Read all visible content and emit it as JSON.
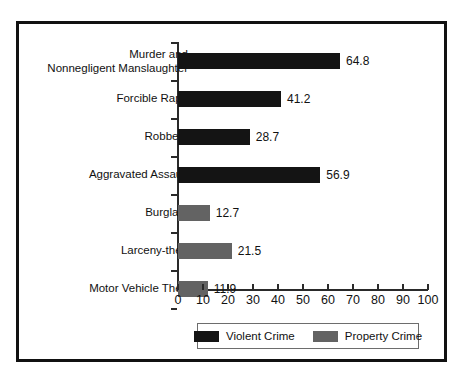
{
  "chart_data": {
    "type": "bar",
    "orientation": "horizontal",
    "title": "",
    "xlabel": "",
    "ylabel": "",
    "xlim": [
      0,
      100
    ],
    "xticks": [
      0,
      10,
      20,
      30,
      40,
      50,
      60,
      70,
      80,
      90,
      100
    ],
    "xtick_labels": [
      "0",
      "10",
      "20",
      "30",
      "40",
      "50",
      "60",
      "70",
      "80",
      "90",
      "100"
    ],
    "grid": false,
    "legend_position": "bottom",
    "categories": [
      "Murder and\nNonnegligent Manslaughter",
      "Forcible Rape",
      "Robbery",
      "Aggravated Assault",
      "Burglary",
      "Larceny-theft",
      "Motor Vehicle Theft"
    ],
    "values": [
      64.8,
      41.2,
      28.7,
      56.9,
      12.7,
      21.5,
      11.9
    ],
    "value_labels": [
      "64.8",
      "41.2",
      "28.7",
      "56.9",
      "12.7",
      "21.5",
      "11.9"
    ],
    "series_of_category": [
      "violent",
      "violent",
      "violent",
      "violent",
      "property",
      "property",
      "property"
    ],
    "series": [
      {
        "name": "Violent Crime",
        "key": "violent",
        "color": "#141414"
      },
      {
        "name": "Property Crime",
        "key": "property",
        "color": "#636363"
      }
    ],
    "legend": [
      {
        "label": "Violent Crime",
        "swatch": "violent"
      },
      {
        "label": "Property Crime",
        "swatch": "property"
      }
    ]
  },
  "colors": {
    "violent": "#141414",
    "property": "#636363",
    "frame": "#111111",
    "axis": "#2a2a2a",
    "text": "#111111",
    "background": "#ffffff"
  }
}
